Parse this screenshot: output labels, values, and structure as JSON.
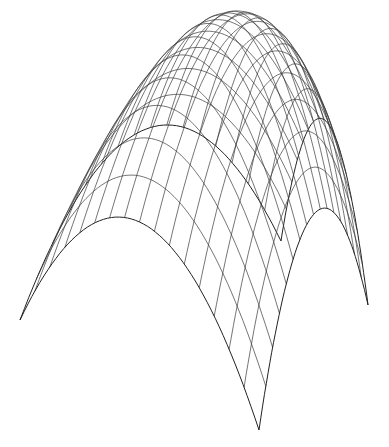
{
  "chart_data": {
    "type": "surface-wireframe",
    "title": "",
    "xlabel": "",
    "ylabel": "",
    "zlabel": "",
    "function": "z = 1 - (x^2 + y^2)/2",
    "x_range": [
      -1,
      1
    ],
    "y_range": [
      -1,
      1
    ],
    "z_range": [
      0,
      1
    ],
    "grid_lines": 17,
    "axes_visible": false,
    "legend": null,
    "projection": {
      "corner_left": [
        20,
        320
      ],
      "corner_front": [
        259,
        430
      ],
      "corner_right": [
        368,
        305
      ],
      "corner_back": [
        281,
        241
      ],
      "height_vector": [
        0,
        -306
      ]
    },
    "colors": {
      "background": "#ffffff",
      "line": "#3a3a3a"
    }
  }
}
